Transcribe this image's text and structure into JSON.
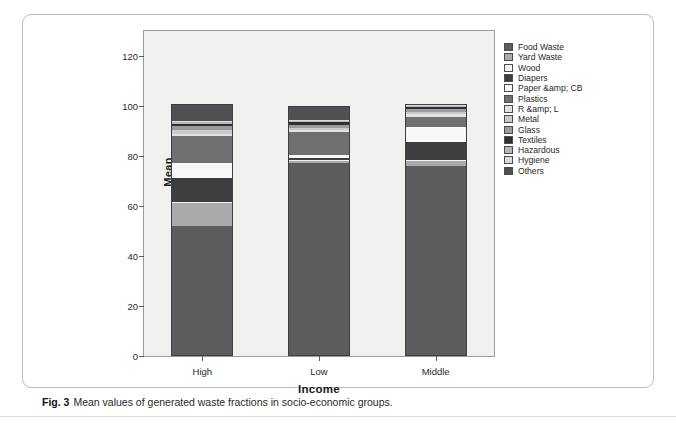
{
  "caption": {
    "fig_number": "Fig. 3",
    "text": "Mean values of generated waste fractions in socio-economic groups."
  },
  "chart_data": {
    "type": "bar",
    "stacked": true,
    "title": "",
    "xlabel": "Income",
    "ylabel": "Mean",
    "categories": [
      "High",
      "Low",
      "Middle"
    ],
    "ylim": [
      0,
      130
    ],
    "yticks": [
      0,
      20,
      40,
      60,
      80,
      100,
      120
    ],
    "ytick_labels": [
      "0",
      "20",
      "40",
      "60",
      "80",
      "100",
      "120"
    ],
    "grid": false,
    "legend_position": "right",
    "series": [
      {
        "name": "Food Waste",
        "color": "#5a5c5e",
        "values": [
          52.5,
          77.5,
          76.5
        ]
      },
      {
        "name": "Yard Waste",
        "color": "#a8aaac",
        "values": [
          9.0,
          0.8,
          2.0
        ]
      },
      {
        "name": "Wood",
        "color": "#f2f2f0",
        "values": [
          0.5,
          0.4,
          0.4
        ]
      },
      {
        "name": "Diapers",
        "color": "#3c3e40",
        "values": [
          9.5,
          0.8,
          7.0
        ]
      },
      {
        "name": "Paper &amp; CB",
        "color": "#f7f7f5",
        "values": [
          6.0,
          1.2,
          6.0
        ]
      },
      {
        "name": "Plastics",
        "color": "#6e7072",
        "values": [
          11.0,
          9.5,
          4.0
        ]
      },
      {
        "name": "R &amp; L",
        "color": "#e2e2e0",
        "values": [
          0.6,
          0.5,
          1.5
        ]
      },
      {
        "name": "Metal",
        "color": "#c8cacb",
        "values": [
          1.6,
          1.0,
          0.8
        ]
      },
      {
        "name": "Glass",
        "color": "#9a9c9e",
        "values": [
          1.8,
          1.2,
          0.9
        ]
      },
      {
        "name": "Textiles",
        "color": "#2e3032",
        "values": [
          0.8,
          1.0,
          0.8
        ]
      },
      {
        "name": "Hazardous",
        "color": "#b4b6b8",
        "values": [
          0.6,
          0.5,
          0.5
        ]
      },
      {
        "name": "Hygiene",
        "color": "#dcdcda",
        "values": [
          0.6,
          0.6,
          0.6
        ]
      },
      {
        "name": "Others",
        "color": "#4e5052",
        "values": [
          6.5,
          5.0,
          0.0
        ]
      }
    ],
    "legend_entries": [
      {
        "label": "Food Waste",
        "color": "#5a5c5e"
      },
      {
        "label": "Yard Waste",
        "color": "#a8aaac"
      },
      {
        "label": "Wood",
        "color": "#f2f2f0"
      },
      {
        "label": "Diapers",
        "color": "#3c3e40"
      },
      {
        "label": "Paper &amp; CB",
        "color": "#f7f7f5"
      },
      {
        "label": "Plastics",
        "color": "#6e7072"
      },
      {
        "label": "R &amp; L",
        "color": "#e2e2e0"
      },
      {
        "label": "Metal",
        "color": "#c8cacb"
      },
      {
        "label": "Glass",
        "color": "#9a9c9e"
      },
      {
        "label": "Textiles",
        "color": "#2e3032"
      },
      {
        "label": "Hazardous",
        "color": "#b4b6b8"
      },
      {
        "label": "Hygiene",
        "color": "#dcdcda"
      },
      {
        "label": "Others",
        "color": "#4e5052"
      }
    ]
  }
}
